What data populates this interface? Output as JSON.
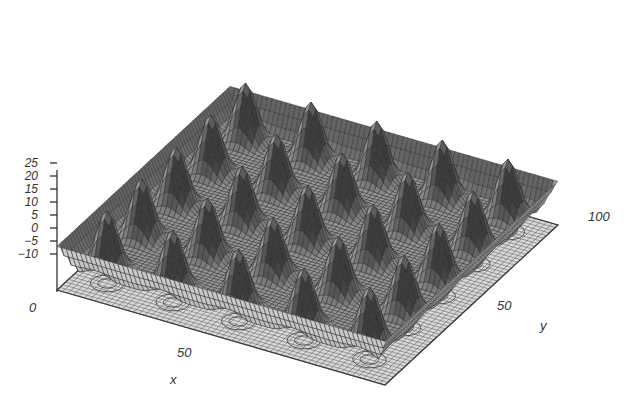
{
  "chart_data": {
    "type": "surface3d",
    "title": "",
    "xlabel": "x",
    "ylabel": "y",
    "zlabel": "",
    "x_range": [
      0,
      100
    ],
    "y_range": [
      0,
      100
    ],
    "z_range": [
      -10,
      25
    ],
    "z_ticks": [
      "25",
      "20",
      "15",
      "10",
      "5",
      "0",
      "−5",
      "−10"
    ],
    "x_ticks": [
      "0",
      "50"
    ],
    "y_ticks": [
      "50",
      "100"
    ],
    "peak_grid": {
      "rows": 5,
      "cols": 5,
      "period": 20
    },
    "floor_contours": true,
    "grid": false
  },
  "axes": {
    "x_label": "x",
    "y_label": "y",
    "x_tick_0": "0",
    "x_tick_50": "50",
    "y_tick_50": "50",
    "y_tick_100": "100",
    "z_ticks": [
      "25",
      "20",
      "15",
      "10",
      "5",
      "0",
      "−5",
      "−10"
    ]
  }
}
